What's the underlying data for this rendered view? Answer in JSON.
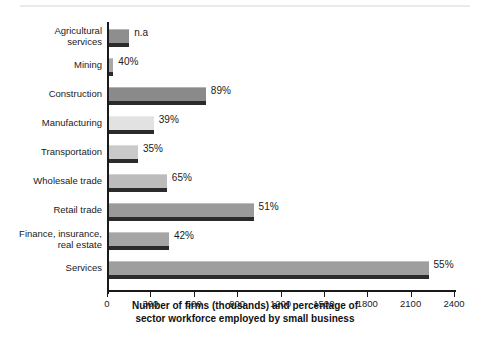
{
  "figure": {
    "top_rule": "decorative-rule"
  },
  "chart_data": {
    "type": "bar",
    "orientation": "horizontal",
    "title": "",
    "xlabel_line1": "Number of firms (thousands) and percentage of",
    "xlabel_line2": "sector workforce employed by small business",
    "ylabel": "",
    "xlim": [
      0,
      2400
    ],
    "xticks": [
      0,
      300,
      600,
      900,
      1200,
      1500,
      1800,
      2100,
      2400
    ],
    "xtick_labels": [
      "0",
      "300",
      "600",
      "900",
      "1200",
      "1500",
      "1800",
      "2100",
      "2400"
    ],
    "grid": false,
    "legend": "none",
    "categories": [
      "Agricultural\nservices",
      "Mining",
      "Construction",
      "Manufacturing",
      "Transportation",
      "Wholesale trade",
      "Retail trade",
      "Finance, insurance,\nreal estate",
      "Services"
    ],
    "values": [
      140,
      30,
      670,
      310,
      200,
      400,
      1000,
      415,
      2210
    ],
    "value_labels": [
      "n.a",
      "40%",
      "89%",
      "39%",
      "35%",
      "65%",
      "51%",
      "42%",
      "55%"
    ],
    "bar_colors": [
      "#8e8e8e",
      "#a8a8a8",
      "#8a8a8a",
      "#e2e2e2",
      "#c9c9c9",
      "#bcbcbc",
      "#9a9a9a",
      "#a5a5a5",
      "#9e9e9e"
    ],
    "shadow_color": "#2b2b2b",
    "axis_color": "#1a1a1a"
  }
}
